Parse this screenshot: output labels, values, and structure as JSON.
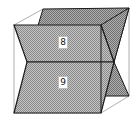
{
  "figure": {
    "colors": {
      "background": "#ffffff",
      "plane_fill": "#b8b8b8",
      "plane_fill_back": "#a6a6a6",
      "edge_dark": "#1a1a1a",
      "edge_light": "#9a9a9a"
    },
    "labels": [
      {
        "text": "8",
        "x": 58,
        "y": 36
      },
      {
        "text": "9",
        "x": 58,
        "y": 76
      }
    ]
  }
}
